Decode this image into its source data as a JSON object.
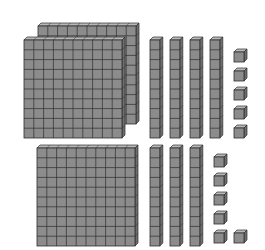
{
  "diagram": {
    "kind": "base-ten blocks",
    "colors": {
      "face": "#8c8c8c",
      "top": "#b8b8b8",
      "side": "#6e6e6e",
      "edge": "#2e2e2e",
      "background": "#ffffff"
    },
    "groups": [
      {
        "name": "top-group",
        "flats": 2,
        "rods": 4,
        "units": 5,
        "value": 245,
        "flat_positions": [
          [
            38,
            26
          ],
          [
            24,
            40
          ]
        ],
        "rod_x": [
          150,
          170,
          190,
          210
        ],
        "rod_y": 40,
        "unit_positions": [
          [
            234,
            52
          ],
          [
            234,
            71
          ],
          [
            234,
            90
          ],
          [
            234,
            109
          ],
          [
            234,
            128
          ]
        ]
      },
      {
        "name": "bottom-group",
        "flats": 1,
        "rods": 3,
        "units": 6,
        "value": 136,
        "flat_positions": [
          [
            37,
            148
          ]
        ],
        "rod_x": [
          150,
          170,
          190
        ],
        "rod_y": 148,
        "unit_positions": [
          [
            214,
            157
          ],
          [
            214,
            176
          ],
          [
            214,
            195
          ],
          [
            214,
            214
          ],
          [
            214,
            233
          ],
          [
            234,
            233
          ]
        ]
      }
    ]
  }
}
